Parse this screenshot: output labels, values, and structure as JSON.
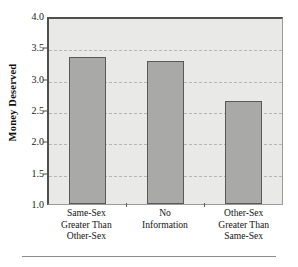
{
  "chart_data": {
    "type": "bar",
    "title": "",
    "xlabel": "",
    "ylabel": "Money Deserved",
    "categories": [
      "Same-Sex Greater Than Other-Sex",
      "No Information",
      "Other-Sex Greater Than Same-Sex"
    ],
    "category_lines": [
      [
        "Same-Sex",
        "Greater Than",
        "Other-Sex"
      ],
      [
        "No",
        "Information"
      ],
      [
        "Other-Sex",
        "Greater Than",
        "Same-Sex"
      ]
    ],
    "values": [
      3.35,
      3.28,
      2.65
    ],
    "ylim": [
      1.0,
      4.0
    ],
    "yticks": [
      1.0,
      1.5,
      2.0,
      2.5,
      3.0,
      3.5,
      4.0
    ],
    "ytick_labels": [
      "1.0",
      "1.5",
      "2.0",
      "2.5",
      "3.0",
      "3.5",
      "4.0"
    ],
    "grid": true,
    "grid_axis": "y",
    "legend": false,
    "legend_position": "none",
    "colors": {
      "bar_fill": "#a9a9a7",
      "bar_edge": "#595959",
      "plot_background": "#e9e9e7",
      "gridline": "#b6b6b4",
      "axis": "#4f4f4f",
      "text": "#141414",
      "figure_background": "#ffffff",
      "rule": "#8d8d8d"
    }
  },
  "axis": {
    "y_title": "Money Deserved"
  }
}
